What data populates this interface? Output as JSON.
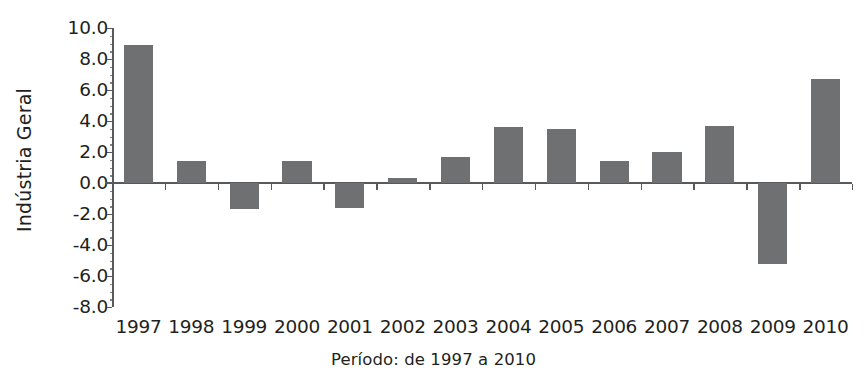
{
  "chart_data": {
    "type": "bar",
    "title": "",
    "xlabel": "Período: de 1997 a 2010",
    "ylabel": "Indústria Geral",
    "categories": [
      "1997",
      "1998",
      "1999",
      "2000",
      "2001",
      "2002",
      "2003",
      "2004",
      "2005",
      "2006",
      "2007",
      "2008",
      "2009",
      "2010"
    ],
    "values": [
      8.9,
      1.4,
      -1.7,
      1.4,
      -1.6,
      0.3,
      1.7,
      3.6,
      3.5,
      1.4,
      2.0,
      3.7,
      -5.2,
      6.7
    ],
    "series": [
      {
        "name": "Indústria Geral",
        "values": [
          8.9,
          1.4,
          -1.7,
          1.4,
          -1.6,
          0.3,
          1.7,
          3.6,
          3.5,
          1.4,
          2.0,
          3.7,
          -5.2,
          6.7
        ]
      }
    ],
    "ylim": [
      -8.0,
      10.0
    ],
    "ytick_labels": [
      "10.0",
      "8.0",
      "6.0",
      "4.0",
      "2.0",
      "0.0",
      "-2.0",
      "-4.0",
      "-6.0",
      "-8.0"
    ],
    "ytick_values": [
      10.0,
      8.0,
      6.0,
      4.0,
      2.0,
      0.0,
      -2.0,
      -4.0,
      -6.0,
      -8.0
    ],
    "grid": false,
    "legend": "none",
    "bar_color": "#6f7071",
    "axis_color": "#58595b",
    "text_color": "#231f20",
    "background": "#ffffff"
  }
}
